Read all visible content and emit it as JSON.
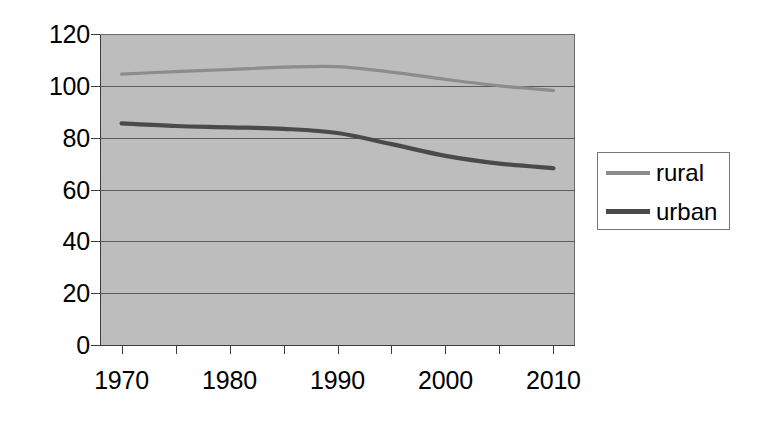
{
  "chart_data": {
    "type": "line",
    "title": "",
    "subtitle": "",
    "xlabel": "",
    "ylabel": "",
    "x": [
      1970,
      1975,
      1980,
      1985,
      1990,
      1995,
      2000,
      2005,
      2010
    ],
    "xlim": [
      1968,
      2012
    ],
    "ylim": [
      0,
      120
    ],
    "yticks": [
      0,
      20,
      40,
      60,
      80,
      100,
      120
    ],
    "xticks": [
      1970,
      1980,
      1990,
      2000,
      2010
    ],
    "xtick_labels": [
      "1970",
      "1980",
      "1990",
      "2000",
      "2010"
    ],
    "ytick_labels": [
      "120",
      "100",
      "80",
      "60",
      "40",
      "20",
      "0"
    ],
    "grid": "horizontal",
    "plot_background": "#bdbdbd",
    "legend_position": "right",
    "series": [
      {
        "name": "rural",
        "color": "#8c8c8c",
        "values": [
          104.5,
          105.5,
          106.3,
          107.2,
          107.4,
          105.3,
          102.5,
          100.0,
          98.2
        ]
      },
      {
        "name": "urban",
        "color": "#4a4a4a",
        "values": [
          85.5,
          84.5,
          84.0,
          83.4,
          81.8,
          77.5,
          73.0,
          70.0,
          68.2
        ]
      }
    ]
  },
  "legend": {
    "entries": [
      {
        "label": "rural",
        "color": "#8c8c8c"
      },
      {
        "label": "urban",
        "color": "#4a4a4a"
      }
    ]
  },
  "axes": {
    "y_labels": [
      "120",
      "100",
      "80",
      "60",
      "40",
      "20",
      "0"
    ],
    "x_labels": [
      "1970",
      "1980",
      "1990",
      "2000",
      "2010"
    ]
  },
  "colors": {
    "plot_area": "#bdbdbd",
    "gridline": "#5a5a5a",
    "axis": "#3c3c3c",
    "rural": "#8c8c8c",
    "urban": "#4a4a4a",
    "text": "#000000",
    "page_background": "#ffffff"
  }
}
